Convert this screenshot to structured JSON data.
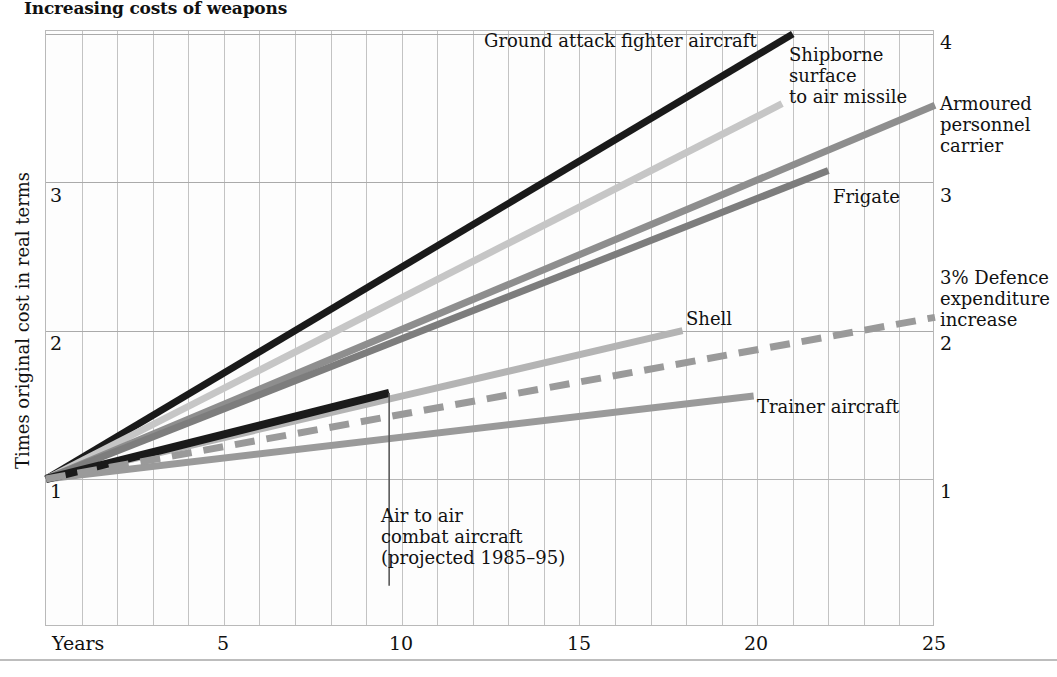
{
  "title": "Increasing costs of weapons",
  "axes": {
    "xlabel": "Years",
    "ylabel": "Times original cost in real terms",
    "x_ticks": [
      "5",
      "10",
      "15",
      "20",
      "25"
    ],
    "x_tick_values": [
      5,
      10,
      15,
      20,
      25
    ],
    "y_ticks_left": [
      "1",
      "2",
      "3"
    ],
    "y_ticks_right": [
      "1",
      "2",
      "3",
      "4"
    ],
    "xlim": [
      0,
      25
    ],
    "ylim": [
      0.0,
      4.03
    ],
    "grid": "both"
  },
  "annotations": {
    "ground_attack": "Ground attack fighter aircraft",
    "shipborne": "Shipborne\nsurface\nto air missile",
    "apc": "Armoured\npersonnel\ncarrier",
    "frigate": "Frigate",
    "defence": "3% Defence\nexpenditure\nincrease",
    "shell": "Shell",
    "trainer": "Trainer aircraft",
    "air_to_air": "Air to air\ncombat aircraft\n(projected 1985–95)"
  },
  "colors": {
    "ink": "#111111",
    "grid_minor": "#c3c3c3",
    "grid_major": "#aaaaaa",
    "series_black": "#1a1a1a",
    "series_light": "#c6c6c6",
    "series_mid": "#8e8e8e",
    "series_darkmid": "#7d7d7d",
    "series_pale": "#b4b4b4",
    "series_dash": "#9a9a9a"
  },
  "chart_data": {
    "type": "line",
    "title": "Increasing costs of weapons",
    "xlabel": "Years",
    "ylabel": "Times original cost in real terms",
    "xlim": [
      0,
      25
    ],
    "ylim": [
      1.0,
      4.03
    ],
    "grid": true,
    "legend": "inline-annotations",
    "note": "All series start at (0, 1) — one times original cost — and rise linearly.",
    "series": [
      {
        "name": "Ground attack fighter aircraft",
        "color": "#1a1a1a",
        "style": "solid",
        "width": 7,
        "x": [
          0,
          21
        ],
        "y": [
          1.0,
          4.0
        ],
        "annual_growth_factor": 0.143,
        "label_pos": {
          "x": 13.6,
          "y": 4.0
        }
      },
      {
        "name": "Shipborne surface to air missile",
        "color": "#c6c6c6",
        "style": "solid",
        "width": 7,
        "x": [
          0,
          20.7
        ],
        "y": [
          1.0,
          3.53
        ],
        "annual_growth_factor": 0.122,
        "label_pos": {
          "x": 21.0,
          "y": 3.82
        }
      },
      {
        "name": "Armoured personnel carrier",
        "color": "#8e8e8e",
        "style": "solid",
        "width": 7,
        "x": [
          0,
          25
        ],
        "y": [
          1.0,
          3.52
        ],
        "annual_growth_factor": 0.101,
        "label_pos": {
          "x": 25.2,
          "y": 3.35
        }
      },
      {
        "name": "Frigate",
        "color": "#7d7d7d",
        "style": "solid",
        "width": 7,
        "x": [
          0,
          22
        ],
        "y": [
          1.0,
          3.08
        ],
        "annual_growth_factor": 0.095,
        "label_pos": {
          "x": 22.3,
          "y": 3.02
        }
      },
      {
        "name": "Shell",
        "color": "#b4b4b4",
        "style": "solid",
        "width": 7,
        "x": [
          0,
          17.9
        ],
        "y": [
          1.0,
          2.0
        ],
        "annual_growth_factor": 0.056,
        "label_pos": {
          "x": 15.3,
          "y": 2.12
        }
      },
      {
        "name": "Trainer aircraft",
        "color": "#9a9a9a",
        "style": "solid",
        "width": 7,
        "x": [
          0,
          19.9
        ],
        "y": [
          1.0,
          1.56
        ],
        "annual_growth_factor": 0.028,
        "label_pos": {
          "x": 20.2,
          "y": 1.58
        }
      },
      {
        "name": "Air to air combat aircraft (projected 1985–95)",
        "color": "#1a1a1a",
        "style": "solid",
        "width": 8,
        "x": [
          0,
          9.65
        ],
        "y": [
          1.0,
          1.58
        ],
        "annual_growth_factor": 0.06,
        "label_pos": {
          "x": 9.5,
          "y": 0.75
        }
      },
      {
        "name": "3% Defence expenditure increase",
        "color": "#9a9a9a",
        "style": "dashed",
        "width": 7,
        "x": [
          0,
          25
        ],
        "y": [
          1.0,
          2.09
        ],
        "annual_growth_factor": 0.0436,
        "label_pos": {
          "x": 25.2,
          "y": 2.55
        }
      }
    ]
  }
}
